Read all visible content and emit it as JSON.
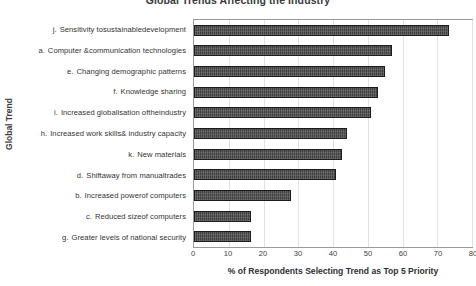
{
  "chart_data": {
    "type": "bar",
    "orientation": "horizontal",
    "title": "Global Trends Affecting the Industry",
    "xlabel": "% of Respondents Selecting Trend as Top 5 Priority",
    "ylabel": "Global Trend",
    "xlim": [
      0,
      80
    ],
    "xticks": [
      0,
      10,
      20,
      30,
      40,
      50,
      60,
      70,
      80
    ],
    "grid": "vertical",
    "legend": "none",
    "bar_color": "#404040",
    "bar_edge_color": "#1c1c1c",
    "categories": [
      "j.  Sensitivity tosustainabledevelopment",
      "a.  Computer &communication technologies",
      "e.  Changing demographic patterns",
      "f.  Knowledge sharing",
      "i.  Increased globalisation oftheindustry",
      "h.  Increased work skills& industry capacity",
      "k.  New materials",
      "d.  Shiftaway from manualtrades",
      "b.  Increased powerof computers",
      "c.  Reduced sizeof computers",
      "g.  Greater levels of national security"
    ],
    "category_keys": [
      "j.",
      "a.",
      "e.",
      "f.",
      "i.",
      "h.",
      "k.",
      "d.",
      "b.",
      "c.",
      "g."
    ],
    "category_texts": [
      "Sensitivity tosustainabledevelopment",
      "Computer &communication technologies",
      "Changing demographic patterns",
      "Knowledge sharing",
      "Increased globalisation oftheindustry",
      "Increased work skills& industry capacity",
      "New materials",
      "Shiftaway from manualtrades",
      "Increased powerof computers",
      "Reduced sizeof computers",
      "Greater levels of national security"
    ],
    "values": [
      73.5,
      57,
      55,
      53,
      51,
      44,
      42.5,
      41,
      28,
      16.5,
      16.5
    ]
  }
}
